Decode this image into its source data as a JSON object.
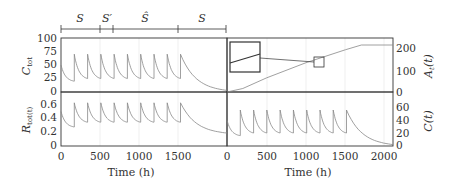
{
  "phases": {
    "labels": [
      "S",
      "S′",
      "Ŝ",
      "S"
    ],
    "boundaries_h": [
      0,
      500,
      660,
      1500,
      2100
    ]
  },
  "axes": {
    "left_top_ylabel": "C_tot",
    "left_bottom_ylabel": "R_tot(t)",
    "right_top_ylabel": "A_t(t)",
    "right_bottom_ylabel": "C(t)",
    "xlabel_left": "Time (h)",
    "xlabel_right": "Time (h)",
    "left_top_yticks": [
      "100",
      "75",
      "50",
      "25",
      "0"
    ],
    "left_bottom_yticks": [
      "0.6",
      "0.4",
      "0.2",
      "0"
    ],
    "right_top_yticks": [
      "200",
      "100",
      "0"
    ],
    "right_bottom_yticks": [
      "60",
      "40",
      "20",
      "0"
    ],
    "left_xticks": [
      "0",
      "500",
      "1000",
      "1500"
    ],
    "right_xticks": [
      "0",
      "500",
      "1000",
      "1500",
      "2000"
    ]
  },
  "chart_data": [
    {
      "type": "line",
      "title": "",
      "xlabel": "Time (h)",
      "ylabel": "C_tot",
      "xlim": [
        0,
        2100
      ],
      "ylim": [
        0,
        100
      ],
      "grid": true,
      "series": [
        {
          "name": "C_tot",
          "dose_times_h": [
            0,
            168,
            336,
            504,
            672,
            840,
            1008,
            1176,
            1344,
            1512
          ],
          "peak": 70,
          "trough": 25,
          "tail_end": 3
        }
      ]
    },
    {
      "type": "line",
      "xlabel": "Time (h)",
      "ylabel": "A_t(t)",
      "xlim": [
        0,
        2100
      ],
      "ylim": [
        0,
        230
      ],
      "grid": true,
      "series": [
        {
          "name": "A_t(t)",
          "x": [
            0,
            200,
            500,
            1000,
            1500,
            1700,
            2100
          ],
          "y": [
            0,
            15,
            60,
            125,
            180,
            200,
            200
          ]
        }
      ],
      "annotations": [
        "zoom inset box linked to small square near t≈1200"
      ]
    },
    {
      "type": "line",
      "xlabel": "Time (h)",
      "ylabel": "R_tot(t)",
      "xlim": [
        0,
        2100
      ],
      "ylim": [
        0,
        0.75
      ],
      "grid": true,
      "series": [
        {
          "name": "R_tot(t)",
          "dose_times_h": [
            0,
            168,
            336,
            504,
            672,
            840,
            1008,
            1176,
            1344,
            1512
          ],
          "peak": 0.6,
          "trough": 0.33,
          "tail_end": 0.18
        }
      ]
    },
    {
      "type": "line",
      "xlabel": "Time (h)",
      "ylabel": "C(t)",
      "xlim": [
        0,
        2100
      ],
      "ylim": [
        0,
        75
      ],
      "grid": true,
      "series": [
        {
          "name": "C(t)",
          "dose_times_h": [
            0,
            168,
            336,
            504,
            672,
            840,
            1008,
            1176,
            1344,
            1512
          ],
          "peak": 50,
          "trough": 18,
          "tail_end": 2
        }
      ]
    }
  ]
}
